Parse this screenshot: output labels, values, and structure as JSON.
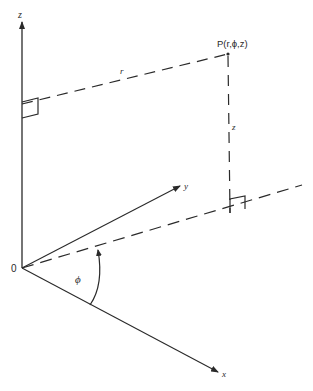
{
  "diagram": {
    "colors": {
      "stroke": "#2a2a2a",
      "background": "#ffffff"
    },
    "labels": {
      "z_axis": "z",
      "y_axis": "y",
      "x_axis": "x",
      "origin": "0",
      "point": "P(r,ϕ,z)",
      "radius": "r",
      "height": "z",
      "angle": "ϕ"
    }
  }
}
